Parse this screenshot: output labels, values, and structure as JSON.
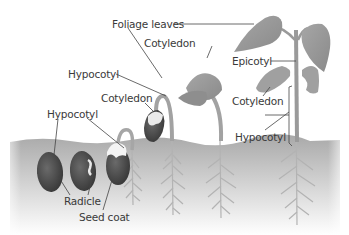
{
  "diagram": {
    "type": "bean seed germination stages",
    "color_mode": "grayscale",
    "colors": {
      "background": "#ffffff",
      "soil_top": "#a9a9a9",
      "soil_bottom": "#ffffff",
      "plant": "#9a9a9a",
      "plant_dark": "#7e7e7e",
      "seed": "#4a4a4a",
      "seed_coat_light": "#f2f2f2",
      "root": "#b0b0b0",
      "leader_line": "#444444",
      "text": "#3a3a3a"
    },
    "labels": {
      "foliage_leaves": "Foliage leaves",
      "cotyledon_top": "Cotyledon",
      "hypocotyl_mid": "Hypocotyl",
      "cotyledon_mid": "Cotyledon",
      "hypocotyl_left": "Hypocotyl",
      "radicle": "Radicle",
      "seed_coat": "Seed coat",
      "epicotyl": "Epicotyl",
      "cotyledon_right": "Cotyledon",
      "hypocotyl_right": "Hypocotyl"
    },
    "stages": [
      {
        "id": 1,
        "description": "Dry seed"
      },
      {
        "id": 2,
        "description": "Radicle emerging"
      },
      {
        "id": 3,
        "description": "Hypocotyl hook emerging, seed coat splitting"
      },
      {
        "id": 4,
        "description": "Hypocotyl hook pulling cotyledons out of soil"
      },
      {
        "id": 5,
        "description": "Cotyledons and foliage leaves above ground"
      },
      {
        "id": 6,
        "description": "Mature seedling with epicotyl, foliage leaves, shriveled cotyledons"
      }
    ]
  }
}
